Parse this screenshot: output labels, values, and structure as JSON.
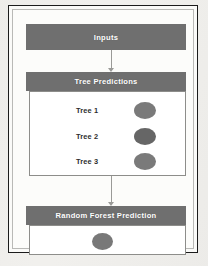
{
  "diagram": {
    "type": "flowchart",
    "colors": {
      "header_fill": "#6f6f6f",
      "header_text": "#ffffff",
      "panel_fill": "#ffffff",
      "panel_border": "#8d8d8a",
      "ellipse_fill": "#7a7a7a",
      "frame": "#1b1b1b",
      "connector": "#9a9a97",
      "label_text": "#2d2d2d"
    },
    "inputs": {
      "label": "Inputs"
    },
    "tree_predictions": {
      "label": "Tree Predictions",
      "rows": [
        {
          "label": "Tree 1",
          "marker": "ellipse",
          "marker_shade": "#7d7d7d"
        },
        {
          "label": "Tree 2",
          "marker": "ellipse",
          "marker_shade": "#666666"
        },
        {
          "label": "Tree 3",
          "marker": "ellipse",
          "marker_shade": "#7d7d7d"
        }
      ]
    },
    "random_forest": {
      "label": "Random Forest Prediction",
      "marker": "ellipse",
      "marker_shade": "#787878"
    },
    "connectors": [
      {
        "from": "Inputs",
        "to": "Tree Predictions",
        "icon": "arrow-down-icon"
      },
      {
        "from": "Tree Predictions",
        "to": "Random Forest Prediction",
        "icon": "arrow-down-icon"
      }
    ]
  }
}
